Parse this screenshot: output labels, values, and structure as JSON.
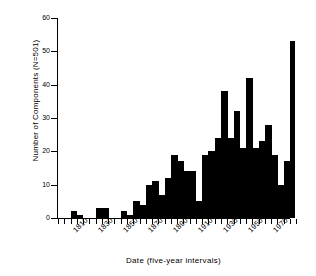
{
  "chart_data": {
    "type": "bar",
    "title": "",
    "xlabel": "Date  (five-year intervals)",
    "ylabel": "Number of Components (N=501)",
    "ylim": [
      0,
      60
    ],
    "y_ticks": [
      0,
      10,
      20,
      30,
      40,
      50,
      60
    ],
    "grid": false,
    "legend": null,
    "bin_width_years": 5,
    "x_tick_labels": [
      "1810",
      "1830",
      "1850",
      "1870",
      "1890",
      "1910",
      "1930",
      "1950",
      "1970"
    ],
    "x_tick_years": [
      1810,
      1830,
      1850,
      1870,
      1890,
      1910,
      1930,
      1950,
      1970
    ],
    "categories": [
      "1800",
      "1805",
      "1810",
      "1815",
      "1820",
      "1825",
      "1830",
      "1835",
      "1840",
      "1845",
      "1850",
      "1855",
      "1860",
      "1865",
      "1870",
      "1875",
      "1880",
      "1885",
      "1890",
      "1895",
      "1900",
      "1905",
      "1910",
      "1915",
      "1920",
      "1925",
      "1930",
      "1935",
      "1940",
      "1945",
      "1950",
      "1955",
      "1960",
      "1965",
      "1970",
      "1975",
      "1980"
    ],
    "values": [
      0,
      0,
      2,
      1,
      0,
      0,
      3,
      3,
      0,
      0,
      2,
      1,
      5,
      4,
      10,
      11,
      7,
      12,
      19,
      17,
      14,
      14,
      5,
      19,
      20,
      24,
      38,
      24,
      32,
      21,
      42,
      21,
      23,
      28,
      19,
      10,
      17
    ],
    "annotations": {
      "max_value": 53,
      "max_bin": "1980",
      "n_total": 501
    }
  },
  "axis": {
    "y_label_text": "Number of Components (N=501)",
    "x_label_text": "Date  (five-year intervals)"
  }
}
